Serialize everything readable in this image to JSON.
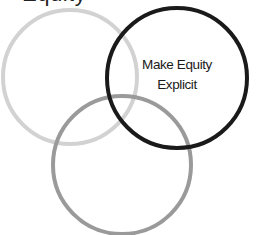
{
  "diagram": {
    "type": "venn",
    "top_text_fragment": "Equity",
    "circles": [
      {
        "id": "left",
        "label": "",
        "stroke": "#d2d2d2",
        "cx": 70,
        "cy": 77,
        "r": 67,
        "stroke_width": 4
      },
      {
        "id": "bottom",
        "label": "",
        "stroke": "#9a9a9a",
        "cx": 122,
        "cy": 165,
        "r": 69,
        "stroke_width": 4
      },
      {
        "id": "right",
        "label": "Make Equity Explicit",
        "stroke": "#1a1a1a",
        "cx": 177,
        "cy": 78,
        "r": 70,
        "stroke_width": 4
      }
    ],
    "label_lines": [
      "Make Equity",
      "Explicit"
    ]
  }
}
